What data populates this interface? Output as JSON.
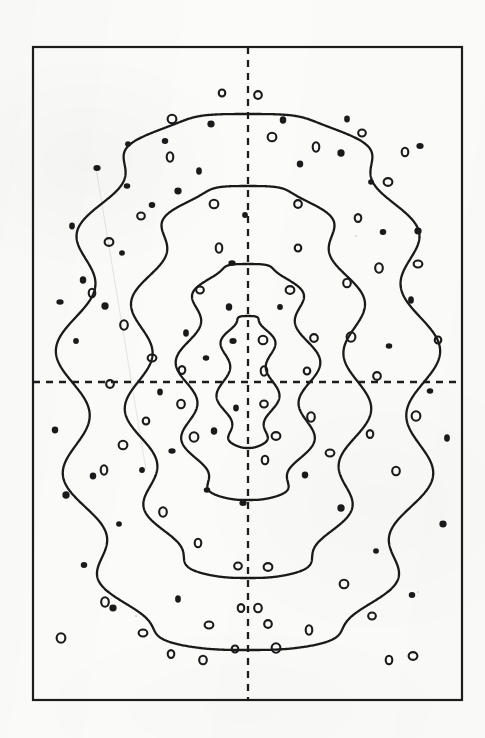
{
  "figure": {
    "kind": "contour-plot",
    "caption": "",
    "background_color": "#fbfbfa",
    "ink_color": "#1a1a1a"
  },
  "frame": {
    "name": "plot-frame",
    "x": 33,
    "y": 47,
    "width": 429,
    "height": 653,
    "stroke": "#1d1d1d",
    "stroke_width": 2.2
  },
  "axes": {
    "vertical_dashed": {
      "label": "vertical-symmetry-axis",
      "x": 248,
      "y1": 47,
      "y2": 700,
      "dash": "7,6",
      "stroke": "#1d1d1d",
      "stroke_width": 2.3
    },
    "horizontal_dashed": {
      "label": "horizontal-symmetry-axis",
      "y": 382,
      "x1": 33,
      "x2": 462,
      "dash": "7,6",
      "stroke": "#1d1d1d",
      "stroke_width": 2.3
    }
  },
  "chart_data": {
    "type": "line",
    "title": "",
    "subtitle": "",
    "xlabel": "",
    "ylabel": "",
    "xlim": [
      33,
      462
    ],
    "ylim": [
      47,
      700
    ],
    "grid": false,
    "legend": "none",
    "annotations": [],
    "center": [
      248,
      382
    ],
    "contours": [
      {
        "name": "contour-outer",
        "level": 1,
        "half_width": 176,
        "half_height": 268,
        "lobes": 13,
        "ripple": 17,
        "closed": true
      },
      {
        "name": "contour-middle",
        "level": 2,
        "half_width": 110,
        "half_height": 196,
        "lobes": 11,
        "ripple": 14,
        "closed": true
      },
      {
        "name": "contour-inner",
        "level": 3,
        "half_width": 62,
        "half_height": 118,
        "lobes": 9,
        "ripple": 11,
        "closed": true
      },
      {
        "name": "contour-core",
        "level": 4,
        "half_width": 25,
        "half_height": 66,
        "lobes": 7,
        "ripple": 7,
        "closed": true
      }
    ],
    "markers": {
      "filled": {
        "style": "solid-dot",
        "fill": "#1a1a1a",
        "radius": 3.4,
        "points": [
          [
            128,
            144
          ],
          [
            165,
            141
          ],
          [
            211,
            124
          ],
          [
            199,
            171
          ],
          [
            127,
            186
          ],
          [
            97,
            168
          ],
          [
            72,
            226
          ],
          [
            83,
            280
          ],
          [
            60,
            302
          ],
          [
            76,
            341
          ],
          [
            55,
            430
          ],
          [
            105,
            306
          ],
          [
            122,
            253
          ],
          [
            152,
            205
          ],
          [
            178,
            191
          ],
          [
            186,
            333
          ],
          [
            206,
            358
          ],
          [
            233,
            341
          ],
          [
            236,
            408
          ],
          [
            214,
            431
          ],
          [
            172,
            451
          ],
          [
            142,
            470
          ],
          [
            93,
            476
          ],
          [
            66,
            495
          ],
          [
            119,
            524
          ],
          [
            84,
            565
          ],
          [
            113,
            608
          ],
          [
            178,
            599
          ],
          [
            207,
            490
          ],
          [
            243,
            503
          ],
          [
            160,
            392
          ],
          [
            229,
            307
          ],
          [
            232,
            263
          ],
          [
            245,
            215
          ],
          [
            300,
            164
          ],
          [
            341,
            153
          ],
          [
            371,
            182
          ],
          [
            383,
            232
          ],
          [
            418,
            231
          ],
          [
            411,
            300
          ],
          [
            389,
            346
          ],
          [
            420,
            146
          ],
          [
            347,
            119
          ],
          [
            283,
            120
          ],
          [
            264,
            341
          ],
          [
            280,
            307
          ],
          [
            305,
            475
          ],
          [
            341,
            508
          ],
          [
            376,
            551
          ],
          [
            412,
            595
          ],
          [
            443,
            524
          ],
          [
            447,
            438
          ],
          [
            430,
            391
          ]
        ]
      },
      "hollow": {
        "style": "ring",
        "stroke": "#1a1a1a",
        "fill": "#fbfbfa",
        "radius": 4.2,
        "stroke_width": 2.1,
        "points": [
          [
            222,
            93
          ],
          [
            258,
            95
          ],
          [
            272,
            137
          ],
          [
            316,
            147
          ],
          [
            362,
            133
          ],
          [
            388,
            182
          ],
          [
            405,
            152
          ],
          [
            379,
            268
          ],
          [
            418,
            264
          ],
          [
            358,
            218
          ],
          [
            347,
            283
          ],
          [
            351,
            337
          ],
          [
            307,
            371
          ],
          [
            314,
            338
          ],
          [
            263,
            340
          ],
          [
            264,
            371
          ],
          [
            264,
            404
          ],
          [
            276,
            436
          ],
          [
            265,
            460
          ],
          [
            311,
            417
          ],
          [
            330,
            453
          ],
          [
            370,
            434
          ],
          [
            396,
            471
          ],
          [
            416,
            416
          ],
          [
            438,
            340
          ],
          [
            377,
            376
          ],
          [
            172,
            119
          ],
          [
            170,
            157
          ],
          [
            141,
            216
          ],
          [
            109,
            242
          ],
          [
            92,
            293
          ],
          [
            124,
            325
          ],
          [
            152,
            358
          ],
          [
            182,
            370
          ],
          [
            181,
            404
          ],
          [
            194,
            437
          ],
          [
            146,
            421
          ],
          [
            110,
            384
          ],
          [
            123,
            445
          ],
          [
            104,
            470
          ],
          [
            238,
            566
          ],
          [
            268,
            567
          ],
          [
            198,
            543
          ],
          [
            163,
            512
          ],
          [
            209,
            625
          ],
          [
            241,
            608
          ],
          [
            258,
            608
          ],
          [
            276,
            648
          ],
          [
            235,
            649
          ],
          [
            268,
            624
          ],
          [
            344,
            584
          ],
          [
            309,
            630
          ],
          [
            372,
            616
          ],
          [
            413,
            656
          ],
          [
            389,
            660
          ],
          [
            105,
            602
          ],
          [
            143,
            633
          ],
          [
            171,
            654
          ],
          [
            203,
            660
          ],
          [
            61,
            638
          ],
          [
            298,
            248
          ],
          [
            298,
            204
          ],
          [
            214,
            204
          ],
          [
            219,
            248
          ],
          [
            200,
            290
          ],
          [
            290,
            290
          ]
        ]
      }
    }
  }
}
